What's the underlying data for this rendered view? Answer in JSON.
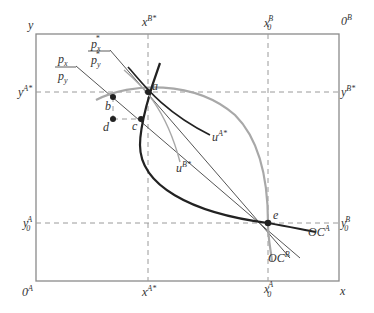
{
  "figure": {
    "colors": {
      "box": "#8a8a8a",
      "dashed": "#9a9a9a",
      "offer_curve_A": "#222222",
      "offer_curve_B": "#a8a8a8",
      "price_line": "#555555",
      "indiff_A": "#222222",
      "indiff_B": "#a8a8a8",
      "text": "#333333"
    }
  },
  "labels": {
    "origin_A": "0",
    "origin_A_sup": "A",
    "origin_B": "0",
    "origin_B_sup": "B",
    "axis_x": "x",
    "axis_y": "y",
    "x_B_star": "x",
    "x_B_star_sup": "B*",
    "x_A_star": "x",
    "x_A_star_sup": "A*",
    "x0_B": "x",
    "x0_B_sup": "B",
    "x0_B_sub": "0",
    "x0_A": "x",
    "x0_A_sup": "A",
    "x0_A_sub": "0",
    "y_A_star": "y",
    "y_A_star_sup": "A*",
    "y_B_star": "y",
    "y_B_star_sup": "B*",
    "y0_A": "y",
    "y0_A_sup": "A",
    "y0_A_sub": "0",
    "y0_B": "y",
    "y0_B_sup": "B",
    "y0_B_sub": "0",
    "price_ratio_num": "p",
    "price_ratio_num_sub": "x",
    "price_ratio_den": "p",
    "price_ratio_den_sub": "y",
    "price_ratio_star_num": "p",
    "price_ratio_star_num_sub": "x",
    "price_ratio_star_num_sup": "*",
    "price_ratio_star_den": "p",
    "price_ratio_star_den_sub": "y",
    "price_ratio_star_den_sup": "*",
    "point_a": "a",
    "point_b": "b",
    "point_c": "c",
    "point_d": "d",
    "point_e": "e",
    "u_A_star": "u",
    "u_A_star_sup": "A*",
    "u_B_star": "u",
    "u_B_star_sup": "B*",
    "OC_A": "OC",
    "OC_A_sup": "A",
    "OC_B": "OC",
    "OC_B_sup": "B"
  }
}
